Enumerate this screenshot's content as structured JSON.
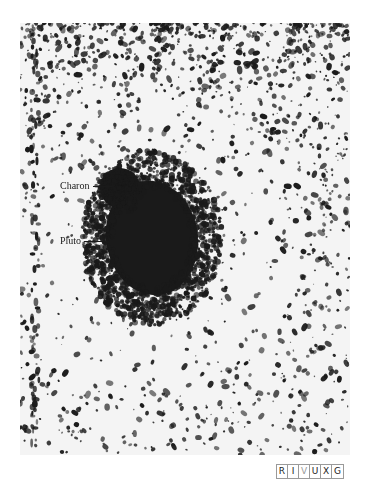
{
  "figure": {
    "kind": "astronomical photograph (ground-based, negative print)",
    "annotations": [
      {
        "id": "charon",
        "label": "Charon",
        "text_x": 60,
        "text_y": 181,
        "line_x1": 93,
        "line_x2": 112,
        "line_y": 186
      },
      {
        "id": "pluto",
        "label": "Pluto",
        "text_x": 60,
        "text_y": 236,
        "line_x1": 84,
        "line_x2": 105,
        "line_y": 241
      }
    ],
    "blob": {
      "cx": 132,
      "cy": 215,
      "rx": 56,
      "ry": 70,
      "bump_cx": 100,
      "bump_cy": 165,
      "bump_r": 20
    },
    "noise": {
      "seed": 7,
      "count": 1900,
      "top_bias": 1.6
    },
    "streak_x": 15
  },
  "wavelength_bands": {
    "letters": [
      "R",
      "I",
      "V",
      "U",
      "X",
      "G"
    ],
    "active": "V"
  },
  "colors": {
    "ink": "#1a1a1a",
    "paper": "#f4f4f4",
    "band_border": "#9a9a9a"
  }
}
